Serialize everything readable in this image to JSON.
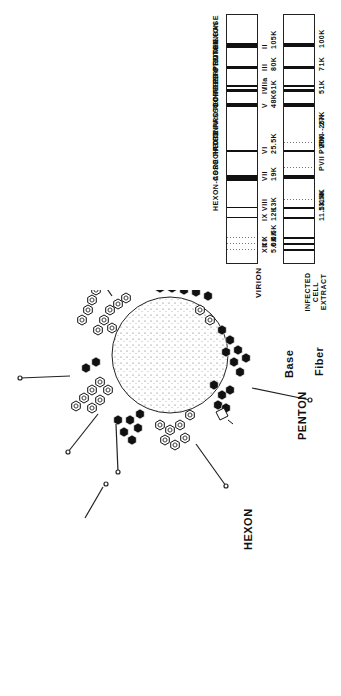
{
  "header": {
    "molecular_weight_label": "MOLECULAR WEIGHT"
  },
  "lanes": {
    "virion": {
      "label": "VIRION",
      "bands": [
        {
          "roman": "II",
          "mw": "105K",
          "protein": "HEXON",
          "pos": 28,
          "thick": 5
        },
        {
          "roman": "III",
          "mw": "80K",
          "protein": "PENTON BASE",
          "pos": 51,
          "thick": 3
        },
        {
          "roman": "IIIa",
          "mw": "",
          "protein": "",
          "pos": 70,
          "thick": 2
        },
        {
          "roman": "IV",
          "mw": "61K",
          "protein": "FIBER",
          "pos": 74,
          "thick": 3
        },
        {
          "roman": "V",
          "mw": "48K",
          "protein": "CORE PROTEIN",
          "pos": 88,
          "thick": 4
        },
        {
          "roman": "VI",
          "mw": "25.5K",
          "protein": "HEXON-ASSOCIATED PROTEIN",
          "pos": 135,
          "thick": 2
        },
        {
          "roman": "VII",
          "mw": "19K",
          "protein": "CORE PROTEIN",
          "pos": 160,
          "thick": 6
        },
        {
          "roman": "VIII",
          "mw": "13K",
          "protein": "HEXON-ASSOCIATED PROTEIN",
          "pos": 192,
          "thick": 1
        },
        {
          "roman": "IX",
          "mw": "12K",
          "protein": "",
          "pos": 202,
          "thick": 1
        },
        {
          "roman": "X",
          "mw": "6.5K",
          "protein": "",
          "pos": 222,
          "thick": 1,
          "faint": true
        },
        {
          "roman": "XI",
          "mw": "6.0K",
          "protein": "",
          "pos": 228,
          "thick": 1,
          "faint": true
        },
        {
          "roman": "XII",
          "mw": "5.0K",
          "protein": "",
          "pos": 234,
          "thick": 1,
          "faint": true
        }
      ]
    },
    "infected_cell_extract": {
      "label": "INFECTED CELL EXTRACT",
      "bands": [
        {
          "mw": "100K",
          "pos": 28,
          "thick": 4
        },
        {
          "mw": "71K",
          "pos": 51,
          "thick": 3
        },
        {
          "mw": "",
          "pos": 70,
          "thick": 2
        },
        {
          "mw": "51K",
          "pos": 74,
          "thick": 3
        },
        {
          "mw": "",
          "pos": 88,
          "thick": 4
        },
        {
          "mw": "PVI - 27K",
          "pos": 127,
          "thick": 1,
          "faint": true
        },
        {
          "mw": "PVIII - 26K",
          "pos": 135,
          "thick": 2
        },
        {
          "mw": "PVII - 20K",
          "pos": 152,
          "thick": 1,
          "faint": true
        },
        {
          "mw": "",
          "pos": 160,
          "thick": 4
        },
        {
          "mw": "14K",
          "pos": 184,
          "thick": 1,
          "faint": true
        },
        {
          "mw": "13.5K",
          "pos": 192,
          "thick": 2
        },
        {
          "mw": "11.5K",
          "pos": 202,
          "thick": 2
        },
        {
          "mw": "",
          "pos": 222,
          "thick": 2
        },
        {
          "mw": "",
          "pos": 228,
          "thick": 2
        },
        {
          "mw": "",
          "pos": 234,
          "thick": 2
        }
      ]
    }
  },
  "diagram": {
    "hexon_label": "HEXON",
    "penton_label": "PENTON",
    "base_label": "Base",
    "fiber_label": "Fiber"
  }
}
